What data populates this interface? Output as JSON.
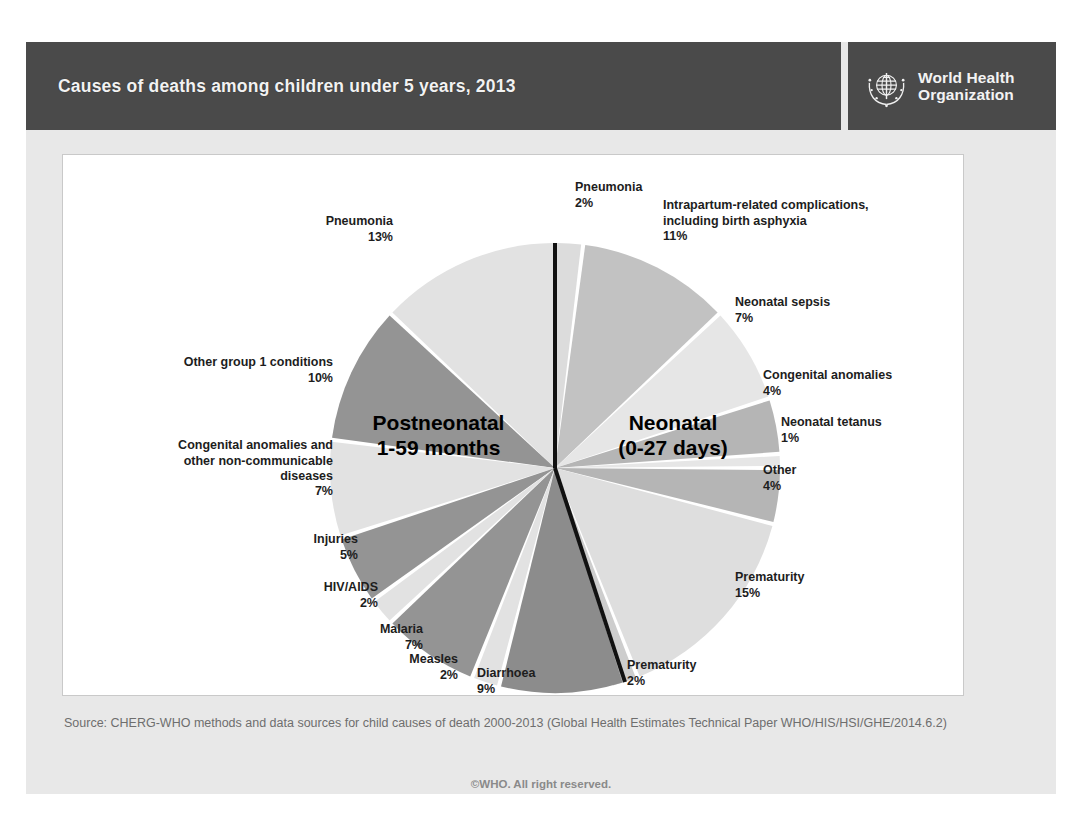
{
  "header": {
    "title": "Causes of deaths among children under 5 years, 2013",
    "logo_line1": "World Health",
    "logo_line2": "Organization",
    "logo_icon": "who-emblem-icon"
  },
  "footer": {
    "source": "Source: CHERG-WHO methods and data sources for child causes of death 2000-2013 (Global Health Estimates Technical Paper WHO/HIS/HSI/GHE/2014.6.2)",
    "copyright": "©WHO. All right reserved."
  },
  "center_labels": {
    "postneonatal": "Postneonatal\n1-59 months",
    "neonatal": "Neonatal\n(0-27 days)"
  },
  "colors": {
    "header_bg": "#4a4a4a",
    "slide_bg": "#e8e8e8",
    "panel_bg": "#ffffff",
    "light": "#e3e3e3",
    "mid_light": "#cfcfcf",
    "mid": "#b9b9b9",
    "dark": "#8f8f8f",
    "divider": "#111111"
  },
  "chart_data": {
    "type": "pie",
    "title": "Causes of deaths among children under 5 years, 2013",
    "legend": "none",
    "units": "percent of deaths",
    "groups": [
      {
        "name": "Neonatal (0-27 days)",
        "total": 44,
        "side": "right",
        "slices": [
          {
            "label": "Pneumonia",
            "pct": 2,
            "pct_text": "2%",
            "fill": "#dcdcdc"
          },
          {
            "label": "Intrapartum-related complications, including birth asphyxia",
            "pct": 11,
            "pct_text": "11%",
            "fill": "#c2c2c2"
          },
          {
            "label": "Neonatal sepsis",
            "pct": 7,
            "pct_text": "7%",
            "fill": "#e6e6e6"
          },
          {
            "label": "Congenital anomalies",
            "pct": 4,
            "pct_text": "4%",
            "fill": "#b5b5b5"
          },
          {
            "label": "Neonatal tetanus",
            "pct": 1,
            "pct_text": "1%",
            "fill": "#e6e6e6"
          },
          {
            "label": "Other",
            "pct": 4,
            "pct_text": "4%",
            "fill": "#b5b5b5"
          },
          {
            "label": "Prematurity",
            "pct": 15,
            "pct_text": "15%",
            "fill": "#dedede"
          },
          {
            "label": "Prematurity",
            "pct": 2,
            "pct_text": "2%",
            "fill": "#cdcdcd"
          }
        ]
      },
      {
        "name": "Postneonatal 1-59 months",
        "total": 56,
        "side": "left",
        "slices": [
          {
            "label": "Pneumonia",
            "pct": 13,
            "pct_text": "13%",
            "fill": "#e2e2e2"
          },
          {
            "label": "Other group 1 conditions",
            "pct": 10,
            "pct_text": "10%",
            "fill": "#949494"
          },
          {
            "label": "Congenital anomalies and other non-communicable diseases",
            "pct": 7,
            "pct_text": "7%",
            "fill": "#e2e2e2"
          },
          {
            "label": "Injuries",
            "pct": 5,
            "pct_text": "5%",
            "fill": "#949494"
          },
          {
            "label": "HIV/AIDS",
            "pct": 2,
            "pct_text": "2%",
            "fill": "#e2e2e2"
          },
          {
            "label": "Malaria",
            "pct": 7,
            "pct_text": "7%",
            "fill": "#949494"
          },
          {
            "label": "Measles",
            "pct": 2,
            "pct_text": "2%",
            "fill": "#e2e2e2"
          },
          {
            "label": "Diarrhoea",
            "pct": 9,
            "pct_text": "9%",
            "fill": "#8c8c8c"
          }
        ]
      }
    ],
    "callouts": [
      {
        "key": "neo_pneumonia",
        "name": "Pneumonia",
        "pct_text": "2%"
      },
      {
        "key": "intrapartum",
        "name": "Intrapartum-related complications,\nincluding birth asphyxia",
        "pct_text": "11%"
      },
      {
        "key": "sepsis",
        "name": "Neonatal sepsis",
        "pct_text": "7%"
      },
      {
        "key": "cong_anom",
        "name": "Congenital anomalies",
        "pct_text": "4%"
      },
      {
        "key": "tetanus",
        "name": "Neonatal tetanus",
        "pct_text": "1%"
      },
      {
        "key": "neo_other",
        "name": "Other",
        "pct_text": "4%"
      },
      {
        "key": "prematurity15",
        "name": "Prematurity",
        "pct_text": "15%"
      },
      {
        "key": "prematurity2",
        "name": "Prematurity",
        "pct_text": "2%"
      },
      {
        "key": "diarrhoea",
        "name": "Diarrhoea",
        "pct_text": "9%"
      },
      {
        "key": "measles",
        "name": "Measles",
        "pct_text": "2%"
      },
      {
        "key": "malaria",
        "name": "Malaria",
        "pct_text": "7%"
      },
      {
        "key": "hiv",
        "name": "HIV/AIDS",
        "pct_text": "2%"
      },
      {
        "key": "injuries",
        "name": "Injuries",
        "pct_text": "5%"
      },
      {
        "key": "cong_ncd",
        "name": "Congenital anomalies and\nother non-communicable\ndiseases",
        "pct_text": "7%"
      },
      {
        "key": "group1",
        "name": "Other group 1 conditions",
        "pct_text": "10%"
      },
      {
        "key": "post_pneumonia",
        "name": "Pneumonia",
        "pct_text": "13%"
      }
    ]
  }
}
